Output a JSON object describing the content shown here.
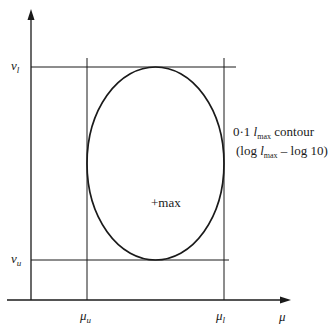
{
  "diagram": {
    "type": "contour-plot-schematic",
    "axes": {
      "x_label": "μ",
      "y_label": ""
    },
    "y_levels": [
      {
        "id": "v_l",
        "symbol": "v",
        "subscript": "l"
      },
      {
        "id": "v_u",
        "symbol": "v",
        "subscript": "u"
      }
    ],
    "x_levels": [
      {
        "id": "mu_u",
        "symbol": "μ",
        "subscript": "u"
      },
      {
        "id": "mu_l",
        "symbol": "μ",
        "subscript": "l"
      }
    ],
    "contour_label": {
      "line1_prefix": "0·1",
      "line1_symbol": "l",
      "line1_sub": "max",
      "line1_suffix": "contour",
      "line2_prefix": "(log",
      "line2_symbol": "l",
      "line2_sub": "max",
      "line2_suffix": "– log 10)"
    },
    "center_label": "+max",
    "colors": {
      "line": "#1a1a1a",
      "background": "#ffffff"
    }
  }
}
